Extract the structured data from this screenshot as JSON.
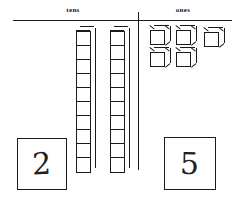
{
  "worksheet": {
    "type": "place-value-base-ten-blocks",
    "columns": [
      {
        "name": "tens",
        "label": "tens",
        "place_value": 10,
        "block_type": "ten-rod",
        "rod_count": 2,
        "segments_per_rod": 10,
        "answer": "2",
        "total_units": 20
      },
      {
        "name": "ones",
        "label": "ones",
        "place_value": 1,
        "block_type": "unit-cube",
        "cube_count": 5,
        "cubes_row_top": 3,
        "cubes_row_bottom": 2,
        "answer": "5",
        "total_units": 5
      }
    ],
    "represented_number": "25",
    "colors": {
      "ink": "#1a1a1a",
      "paper": "#ffffff",
      "handwriting": "#202020"
    }
  }
}
